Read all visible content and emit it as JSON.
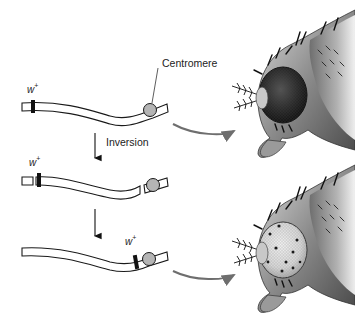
{
  "figure": {
    "type": "diagram",
    "labels": {
      "centromere": "Centromere",
      "inversion": "Inversion",
      "gene_base": "w",
      "gene_sup": "+"
    },
    "chromosomes": [
      {
        "stage": "original",
        "gene": "w+",
        "gene_position": "left, far from centromere",
        "breaks": false
      },
      {
        "stage": "broken",
        "gene": "w+",
        "gene_position": "left, far from centromere",
        "breaks": true
      },
      {
        "stage": "inverted",
        "gene": "w+",
        "gene_position": "adjacent to centromere",
        "breaks": false
      }
    ],
    "outcomes": [
      {
        "from": "original",
        "eye_phenotype": "wild-type (fully pigmented)"
      },
      {
        "from": "inverted",
        "eye_phenotype": "mottled (variegated, mostly white with pigmented spots)"
      }
    ],
    "colors": {
      "outline": "#1a1a1a",
      "centromere_fill": "#b5b5b5",
      "gene_band": "#111111",
      "curved_arrow": "#6e6e6e",
      "text": "#222222"
    }
  }
}
